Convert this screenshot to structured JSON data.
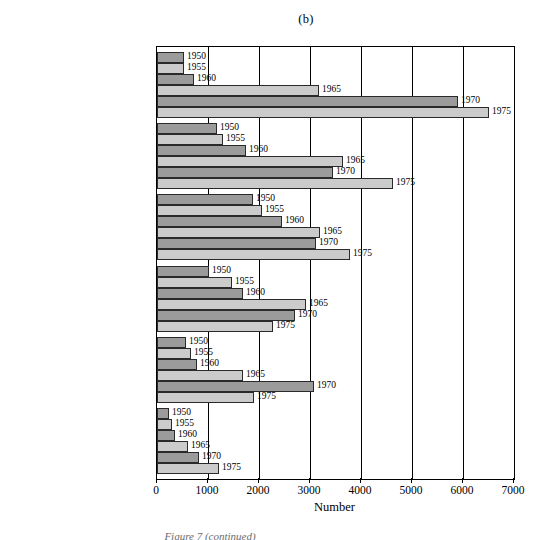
{
  "panel": {
    "title": "(b)",
    "caption": "Figure 7 (continued)"
  },
  "axis": {
    "x_title": "Number",
    "tick_labels": [
      "0",
      "1000",
      "2000",
      "3000",
      "4000",
      "5000",
      "6000",
      "7000"
    ]
  },
  "colors": {
    "bar_dark": "#9b9b9b",
    "bar_light": "#cbcbcb",
    "frame": "#000000",
    "background": "#ffffff"
  },
  "chart_data": {
    "type": "bar",
    "orientation": "horizontal",
    "title": "(b)",
    "xlabel": "Number",
    "ylabel": "",
    "xlim": [
      0,
      7000
    ],
    "xticks": [
      0,
      1000,
      2000,
      3000,
      4000,
      5000,
      6000,
      7000
    ],
    "grid": true,
    "legend": "none",
    "bar_value_labels": true,
    "categories": [
      "Sociology and economics",
      "Science and technology",
      "Fiction",
      "Juvenile",
      "Literature",
      "Sports and recreation"
    ],
    "series": [
      {
        "name": "1950",
        "values": [
          530,
          1170,
          1880,
          1020,
          570,
          240
        ]
      },
      {
        "name": "1955",
        "values": [
          530,
          1300,
          2060,
          1480,
          670,
          290
        ]
      },
      {
        "name": "1960",
        "values": [
          730,
          1750,
          2450,
          1680,
          780,
          360
        ]
      },
      {
        "name": "1965",
        "values": [
          3170,
          3650,
          3200,
          2920,
          1680,
          600
        ]
      },
      {
        "name": "1970",
        "values": [
          5900,
          3460,
          3120,
          2700,
          3080,
          830
        ]
      },
      {
        "name": "1975",
        "values": [
          6500,
          4620,
          3780,
          2270,
          1900,
          1220
        ]
      }
    ]
  }
}
